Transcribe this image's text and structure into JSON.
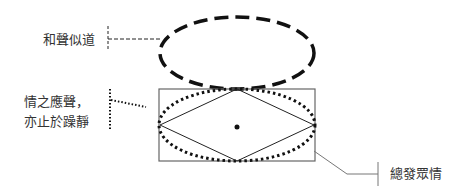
{
  "labels": {
    "harmony": "和聲似道",
    "emotion_line1": "情之應聲，",
    "emotion_line2": "亦止於躁靜",
    "total": "總發眾情"
  },
  "colors": {
    "stroke": "#111111",
    "thin": "#555555",
    "text": "#333333"
  }
}
